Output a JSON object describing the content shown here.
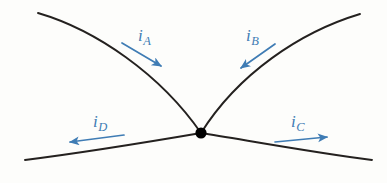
{
  "figure": {
    "background_color": "#fdfdfb",
    "wire_color": "#24211f",
    "node_color": "#000000",
    "arrow_color": "#3f7cb4",
    "width": 387,
    "height": 183
  },
  "junction": {
    "name": "junction-node",
    "x": 201,
    "y": 133,
    "radius": 5.6
  },
  "wires": [
    {
      "name": "wire-upper-left",
      "path": "M 38 13 C 96 30, 160 74, 201 133",
      "end_x": 38,
      "end_y": 13
    },
    {
      "name": "wire-upper-right",
      "path": "M 360 14 C 300 32, 238 74, 201 133",
      "end_x": 360,
      "end_y": 14
    },
    {
      "name": "wire-lower-left",
      "path": "M 25 160 C 88 152, 160 140, 201 133",
      "end_x": 25,
      "end_y": 160
    },
    {
      "name": "wire-lower-right",
      "path": "M 372 160 C 310 152, 240 139, 201 133",
      "end_x": 372,
      "end_y": 160
    }
  ],
  "currents": [
    {
      "name": "current-a",
      "symbol": "i",
      "subscript": "A",
      "label_x": 138,
      "label_y": 27,
      "direction": "into-junction",
      "arrow": {
        "x1": 122,
        "y1": 43,
        "x2": 161,
        "y2": 66
      }
    },
    {
      "name": "current-b",
      "symbol": "i",
      "subscript": "B",
      "label_x": 246,
      "label_y": 27,
      "direction": "into-junction",
      "arrow": {
        "x1": 275,
        "y1": 44,
        "x2": 241,
        "y2": 68
      }
    },
    {
      "name": "current-c",
      "symbol": "i",
      "subscript": "C",
      "label_x": 291,
      "label_y": 113,
      "direction": "out-of-junction",
      "arrow": {
        "x1": 275,
        "y1": 142,
        "x2": 327,
        "y2": 137
      }
    },
    {
      "name": "current-d",
      "symbol": "i",
      "subscript": "D",
      "label_x": 93,
      "label_y": 113,
      "direction": "out-of-junction",
      "arrow": {
        "x1": 124,
        "y1": 135,
        "x2": 70,
        "y2": 142
      }
    }
  ]
}
